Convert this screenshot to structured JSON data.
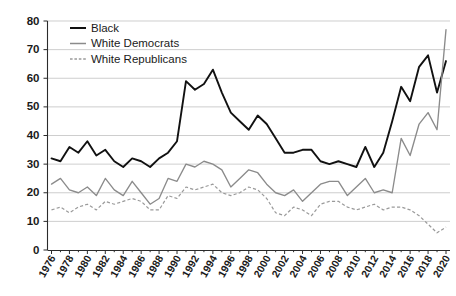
{
  "chart_data": {
    "type": "line",
    "title": "",
    "subtitle": "",
    "xlabel": "",
    "ylabel": "",
    "xlim": [
      1976,
      2021
    ],
    "ylim": [
      0,
      80
    ],
    "yticks": [
      0,
      10,
      20,
      30,
      40,
      50,
      60,
      70,
      80
    ],
    "grid": true,
    "legend_position": "top-left",
    "x": [
      1976,
      1977,
      1978,
      1979,
      1980,
      1981,
      1982,
      1983,
      1984,
      1985,
      1986,
      1987,
      1988,
      1989,
      1990,
      1991,
      1992,
      1993,
      1994,
      1995,
      1996,
      1997,
      1998,
      1999,
      2000,
      2001,
      2002,
      2003,
      2004,
      2005,
      2006,
      2007,
      2008,
      2009,
      2010,
      2011,
      2012,
      2013,
      2014,
      2015,
      2016,
      2017,
      2018,
      2019,
      2020
    ],
    "xtick_labels": [
      "1976",
      "1978",
      "1980",
      "1982",
      "1984",
      "1986",
      "1988",
      "1990",
      "1992",
      "1994",
      "1996",
      "1998",
      "2000",
      "2002",
      "2004",
      "2006",
      "2008",
      "2010",
      "2012",
      "2014",
      "2016",
      "2018",
      "2020"
    ],
    "series": [
      {
        "name": "Black",
        "color": "#111111",
        "style": "solid",
        "values": [
          32,
          31,
          36,
          34,
          38,
          33,
          35,
          31,
          29,
          32,
          31,
          29,
          32,
          34,
          38,
          59,
          56,
          58,
          63,
          55,
          48,
          45,
          42,
          47,
          44,
          39,
          34,
          34,
          35,
          35,
          31,
          30,
          31,
          30,
          29,
          36,
          29,
          34,
          45,
          57,
          52,
          64,
          68,
          55,
          66
        ]
      },
      {
        "name": "White Democrats",
        "color": "#8b8b8b",
        "style": "solid",
        "values": [
          23,
          25,
          21,
          20,
          22,
          19,
          25,
          21,
          19,
          24,
          20,
          16,
          18,
          25,
          24,
          30,
          29,
          31,
          30,
          28,
          22,
          25,
          28,
          27,
          23,
          20,
          19,
          21,
          17,
          20,
          23,
          24,
          24,
          19,
          22,
          25,
          20,
          21,
          20,
          39,
          33,
          44,
          48,
          42,
          77
        ]
      },
      {
        "name": "White Republicans",
        "color": "#9a9a9a",
        "style": "dashed",
        "values": [
          14,
          15,
          13,
          15,
          16,
          14,
          17,
          16,
          17,
          18,
          17,
          14,
          14,
          19,
          18,
          22,
          21,
          22,
          23,
          20,
          19,
          20,
          22,
          21,
          18,
          13,
          12,
          15,
          14,
          12,
          16,
          17,
          17,
          15,
          14,
          15,
          16,
          14,
          15,
          15,
          14,
          12,
          9,
          6,
          8
        ]
      }
    ]
  },
  "legend": {
    "items": [
      {
        "label": "Black"
      },
      {
        "label": "White Democrats"
      },
      {
        "label": "White Republicans"
      }
    ]
  }
}
